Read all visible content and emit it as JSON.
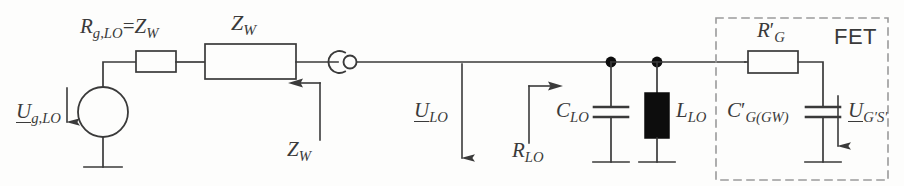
{
  "diagram": {
    "background_color": "#fdfdfc",
    "line_color": "#3a3a3a",
    "fill_black": "#0d0d0d"
  },
  "labels": {
    "source_voltage": {
      "main": "U",
      "sub": "g,LO",
      "underlined": true
    },
    "series_resistor": {
      "main": "R",
      "sub": "g,LO",
      "equals": "=",
      "second_main": "Z",
      "second_sub": "W"
    },
    "line_impedance_box": {
      "main": "Z",
      "sub": "W"
    },
    "line_impedance_arrow": {
      "main": "Z",
      "sub": "W"
    },
    "line_voltage": {
      "main": "U",
      "sub": "LO",
      "underlined": true
    },
    "input_resistance": {
      "main": "R",
      "sub": "LO"
    },
    "capacitor_lo": {
      "main": "C",
      "sub": "LO"
    },
    "inductor_lo": {
      "main": "L",
      "sub": "LO"
    },
    "gate_resistor": {
      "main": "R",
      "prime": "′",
      "sub": "G"
    },
    "gate_capacitor": {
      "main": "C",
      "prime": "′",
      "sub": "G(GW)"
    },
    "gate_source_voltage": {
      "main": "U",
      "sub": "G′S′",
      "underlined": true
    },
    "fet_block": "FET"
  },
  "components": [
    {
      "name": "voltage-source",
      "type": "ac-source-circle",
      "label_ref": "source_voltage"
    },
    {
      "name": "series-resistor",
      "type": "resistor-box",
      "label_ref": "series_resistor"
    },
    {
      "name": "transmission-line",
      "type": "impedance-box",
      "label_ref": "line_impedance_box"
    },
    {
      "name": "coax-connector",
      "type": "connector",
      "label_ref": null
    },
    {
      "name": "capacitor-clo",
      "type": "capacitor",
      "label_ref": "capacitor_lo"
    },
    {
      "name": "inductor-llo",
      "type": "inductor-filled",
      "label_ref": "inductor_lo"
    },
    {
      "name": "gate-resistor",
      "type": "resistor-box",
      "label_ref": "gate_resistor"
    },
    {
      "name": "gate-capacitor",
      "type": "capacitor",
      "label_ref": "gate_capacitor"
    }
  ],
  "annotations": [
    {
      "name": "zw-arrow",
      "direction": "left",
      "label_ref": "line_impedance_arrow"
    },
    {
      "name": "ulo-arrow",
      "direction": "down",
      "label_ref": "line_voltage"
    },
    {
      "name": "rlo-arrow",
      "direction": "right",
      "label_ref": "input_resistance"
    },
    {
      "name": "ugs-arrow",
      "direction": "down",
      "label_ref": "gate_source_voltage"
    },
    {
      "name": "uglo-arrow",
      "direction": "down",
      "label_ref": "source_voltage"
    }
  ]
}
